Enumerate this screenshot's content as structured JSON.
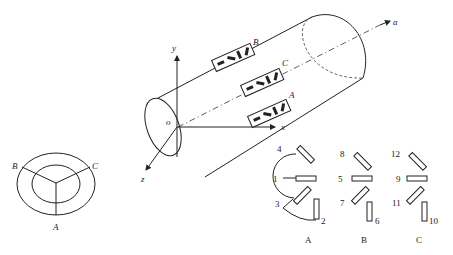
{
  "figure": {
    "cylinder": {
      "axis_labels": {
        "x": "x",
        "y": "y",
        "z": "z",
        "origin": "o",
        "axis": "a"
      },
      "gauge_positions": [
        "B",
        "C",
        "A"
      ]
    },
    "cross_section": {
      "labels": [
        "A",
        "B",
        "C"
      ]
    },
    "rosettes": [
      {
        "label": "A",
        "gauges": [
          "4",
          "1",
          "3",
          "2"
        ]
      },
      {
        "label": "B",
        "gauges": [
          "8",
          "5",
          "7",
          "6"
        ]
      },
      {
        "label": "C",
        "gauges": [
          "12",
          "9",
          "11",
          "10"
        ]
      }
    ]
  }
}
